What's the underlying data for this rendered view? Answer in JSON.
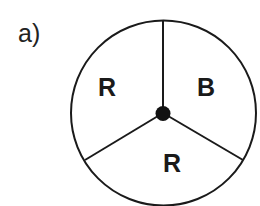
{
  "figure": {
    "part_label": "a)",
    "spinner": {
      "sectors": [
        {
          "label": "R",
          "position": "upper-left"
        },
        {
          "label": "B",
          "position": "upper-right"
        },
        {
          "label": "R",
          "position": "bottom"
        }
      ],
      "sector_count": 3
    }
  },
  "colors": {
    "stroke": "#1a1a1a",
    "background": "#ffffff"
  }
}
